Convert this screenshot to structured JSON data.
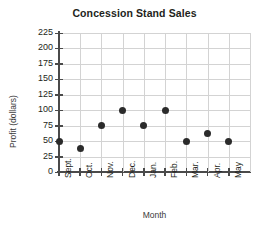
{
  "chart_data": {
    "type": "scatter",
    "title": "Concession Stand Sales",
    "xlabel": "Month",
    "ylabel": "Profit (dollars)",
    "categories": [
      "Sept.",
      "Oct.",
      "Nov.",
      "Dec.",
      "Jan.",
      "Feb.",
      "Mar.",
      "Apr.",
      "May"
    ],
    "values": [
      50,
      38,
      75,
      100,
      75,
      100,
      50,
      62,
      50
    ],
    "yticks": [
      0,
      25,
      50,
      75,
      100,
      125,
      150,
      175,
      200,
      225
    ],
    "ytick_labels": [
      "0",
      "25",
      "50",
      "75",
      "100",
      "125",
      "150",
      "175",
      "200",
      "225"
    ],
    "ylim": [
      0,
      225
    ],
    "grid": true,
    "legend": "none",
    "marker_color": "#2b2b2b",
    "grid_color": "#d3d3d3",
    "axis_color": "#4a4a4a",
    "title_color": "#231f20"
  }
}
